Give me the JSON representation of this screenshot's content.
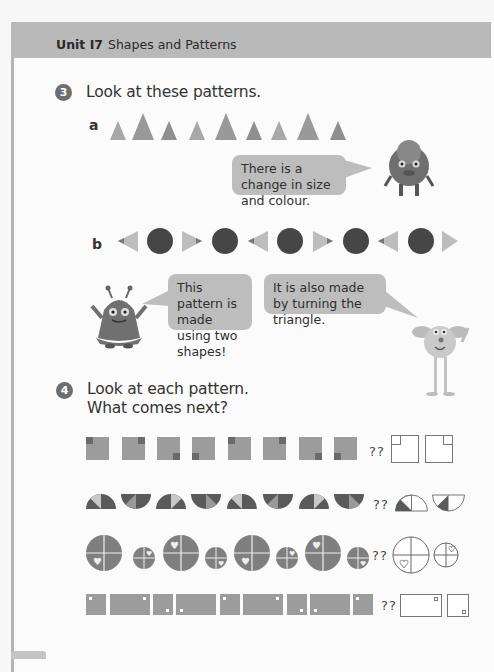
{
  "header": {
    "unit_label": "Unit I7",
    "unit_title": "Shapes and Patterns"
  },
  "question3": {
    "number": "3",
    "prompt": "Look at these patterns.",
    "part_a": {
      "label": "a",
      "shapes": [
        "small-triangle",
        "large-triangle",
        "small-triangle",
        "small-triangle",
        "large-triangle",
        "small-triangle",
        "small-triangle",
        "large-triangle",
        "small-triangle"
      ],
      "bubble": "There is a change in size and colour."
    },
    "part_b": {
      "label": "b",
      "shapes": [
        "triangle-left",
        "circle",
        "triangle-right",
        "circle",
        "triangle-left",
        "circle",
        "triangle-right",
        "circle",
        "triangle-left",
        "circle",
        "triangle-right"
      ],
      "bubble_left": "This pattern is made using two shapes!",
      "bubble_right": "It is also made by turning the triangle."
    }
  },
  "question4": {
    "number": "4",
    "prompt_line1": "Look at each pattern.",
    "prompt_line2": "What comes next?",
    "question_marks": "??",
    "rows": [
      {
        "name": "squares-corner",
        "sequence": [
          "TL",
          "TR",
          "BR",
          "BL",
          "TL",
          "TR",
          "BR",
          "BL"
        ],
        "answers": [
          "TL",
          "TR"
        ]
      },
      {
        "name": "semicircles",
        "sequence": [
          "up",
          "down",
          "up",
          "down",
          "up",
          "down",
          "up",
          "down"
        ],
        "answers": [
          "up",
          "down"
        ]
      },
      {
        "name": "circles-heart",
        "sequence": [
          "big-BL",
          "small-TR",
          "big-TL",
          "small-BR",
          "big-BL",
          "small-TR",
          "big-TL",
          "small-BR"
        ],
        "answers": [
          "big-BL",
          "small-TR"
        ]
      },
      {
        "name": "rects-dot",
        "sequence": [
          "square-TL",
          "rect-TR",
          "square-BR",
          "rect-BL",
          "square-TL",
          "rect-TR",
          "square-BR",
          "rect-BL",
          "square-TL"
        ],
        "answers": [
          "rect-TR",
          "square-BR"
        ]
      }
    ]
  },
  "colors": {
    "header_band": "#b9b9b9",
    "bubble": "#bdbdbd",
    "shape_mid": "#9a9a9a",
    "shape_dark": "#4a4a4a",
    "shape_light": "#c8c8c8"
  }
}
